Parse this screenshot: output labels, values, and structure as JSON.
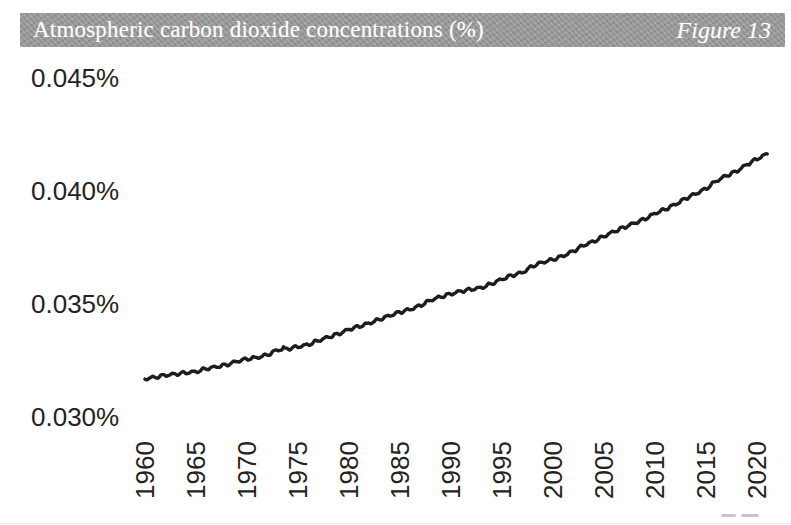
{
  "header": {
    "title": "Atmospheric carbon dioxide concentrations (%)",
    "figure_label": "Figure 13"
  },
  "chart_data": {
    "type": "line",
    "title": "Atmospheric carbon dioxide concentrations (%)",
    "xlabel": "",
    "ylabel": "",
    "grid": false,
    "legend": false,
    "line_color": "#1d1d1d",
    "axis_text_color": "#232323",
    "banner_color": "#9b9b9b",
    "ylim_percent": [
      0.03,
      0.045
    ],
    "xlim_years": [
      1960,
      2021
    ],
    "y_ticks": [
      {
        "value": 0.045,
        "label": "0.045%"
      },
      {
        "value": 0.04,
        "label": "0.040%"
      },
      {
        "value": 0.035,
        "label": "0.035%"
      },
      {
        "value": 0.03,
        "label": "0.030%"
      }
    ],
    "x_ticks": [
      {
        "value": 1960,
        "label": "1960"
      },
      {
        "value": 1965,
        "label": "1965"
      },
      {
        "value": 1970,
        "label": "1970"
      },
      {
        "value": 1975,
        "label": "1975"
      },
      {
        "value": 1980,
        "label": "1980"
      },
      {
        "value": 1985,
        "label": "1985"
      },
      {
        "value": 1990,
        "label": "1990"
      },
      {
        "value": 1995,
        "label": "1995"
      },
      {
        "value": 2000,
        "label": "2000"
      },
      {
        "value": 2005,
        "label": "2005"
      },
      {
        "value": 2010,
        "label": "2010"
      },
      {
        "value": 2015,
        "label": "2015"
      },
      {
        "value": 2020,
        "label": "2020"
      }
    ],
    "x": [
      1960,
      1961,
      1962,
      1963,
      1964,
      1965,
      1966,
      1967,
      1968,
      1969,
      1970,
      1971,
      1972,
      1973,
      1974,
      1975,
      1976,
      1977,
      1978,
      1979,
      1980,
      1981,
      1982,
      1983,
      1984,
      1985,
      1986,
      1987,
      1988,
      1989,
      1990,
      1991,
      1992,
      1993,
      1994,
      1995,
      1996,
      1997,
      1998,
      1999,
      2000,
      2001,
      2002,
      2003,
      2004,
      2005,
      2006,
      2007,
      2008,
      2009,
      2010,
      2011,
      2012,
      2013,
      2014,
      2015,
      2016,
      2017,
      2018,
      2019,
      2020,
      2021
    ],
    "series": [
      {
        "name": "Atmospheric CO2 concentration (%)",
        "values": [
          0.03169,
          0.03176,
          0.03185,
          0.0319,
          0.03196,
          0.032,
          0.03214,
          0.03222,
          0.03231,
          0.03246,
          0.03257,
          0.03263,
          0.03275,
          0.03297,
          0.03302,
          0.03311,
          0.0332,
          0.03338,
          0.03354,
          0.03368,
          0.03388,
          0.03401,
          0.03415,
          0.03432,
          0.03449,
          0.03464,
          0.03476,
          0.03493,
          0.03517,
          0.03532,
          0.03545,
          0.03557,
          0.03565,
          0.03572,
          0.0359,
          0.0361,
          0.03627,
          0.03639,
          0.03668,
          0.03685,
          0.03697,
          0.03713,
          0.03734,
          0.0376,
          0.03777,
          0.038,
          0.03821,
          0.0384,
          0.03858,
          0.03876,
          0.03901,
          0.03919,
          0.03941,
          0.03967,
          0.03988,
          0.0401,
          0.04044,
          0.04068,
          0.04087,
          0.04117,
          0.04142,
          0.04164
        ]
      }
    ]
  }
}
